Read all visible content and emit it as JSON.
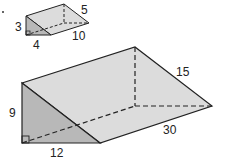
{
  "diagram": {
    "small_prism": {
      "labels": {
        "height": "3",
        "base": "4",
        "length": "10",
        "slant": "5"
      }
    },
    "large_prism": {
      "labels": {
        "height": "9",
        "base": "12",
        "length": "30",
        "slant": "15"
      }
    },
    "colors": {
      "face_light": "#dcdcdc",
      "face_dark": "#b8b8b8",
      "stroke": "#222222"
    }
  }
}
